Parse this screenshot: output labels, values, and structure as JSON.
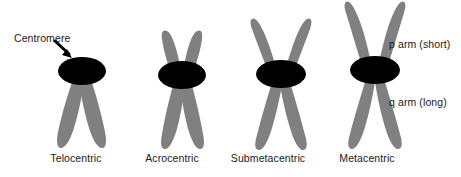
{
  "figure": {
    "background_color": "#FFFFFF",
    "arm_color": "#808080",
    "centromere_color": "#000000",
    "text_color": "#1A1A1A"
  },
  "annotations": {
    "centromere": "Centromere",
    "p_arm": "p arm (short)",
    "q_arm": "q arm (long)"
  },
  "chromosomes": [
    {
      "id": "telocentric",
      "label": "Telocentric",
      "centromere_position": "terminal",
      "p_arm_present": false
    },
    {
      "id": "acrocentric",
      "label": "Acrocentric",
      "centromere_position": "near-terminal",
      "p_arm_present": true
    },
    {
      "id": "submetacentric",
      "label": "Submetacentric",
      "centromere_position": "off-center",
      "p_arm_present": true
    },
    {
      "id": "metacentric",
      "label": "Metacentric",
      "centromere_position": "central",
      "p_arm_present": true
    }
  ]
}
